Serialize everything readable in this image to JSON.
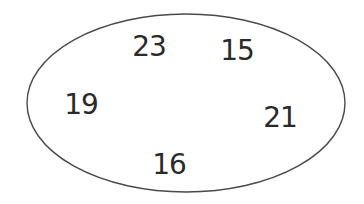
{
  "diagram": {
    "type": "set-ellipse",
    "stroke_color": "#4a4a4a",
    "text_color": "#2a2a2a",
    "background": "#ffffff",
    "ellipse": {
      "cx": 186,
      "cy": 103,
      "rx": 159,
      "ry": 89
    },
    "elements": [
      {
        "label": "23",
        "x": 149,
        "y": 47
      },
      {
        "label": "15",
        "x": 237,
        "y": 51
      },
      {
        "label": "19",
        "x": 81,
        "y": 105
      },
      {
        "label": "21",
        "x": 280,
        "y": 118
      },
      {
        "label": "16",
        "x": 169,
        "y": 165
      }
    ]
  }
}
